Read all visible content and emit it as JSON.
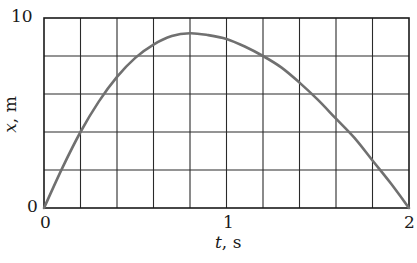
{
  "chart_data": {
    "type": "line",
    "title": "",
    "xlabel": "t, s",
    "xlabel_var": "t",
    "xlabel_unit": ", s",
    "ylabel": "x, m",
    "ylabel_var": "x",
    "ylabel_unit": ", m",
    "xlim": [
      0,
      2
    ],
    "ylim": [
      0,
      10
    ],
    "x_ticks": [
      0,
      1,
      2
    ],
    "x_tick_labels": [
      "0",
      "1",
      "2"
    ],
    "y_ticks": [
      0,
      10
    ],
    "y_tick_labels": [
      "0",
      "10"
    ],
    "grid": true,
    "grid_x_step": 0.2,
    "grid_y_step": 2,
    "legend": null,
    "series": [
      {
        "name": "x(t)",
        "color": "#707070",
        "x": [
          0,
          0.1,
          0.2,
          0.3,
          0.4,
          0.5,
          0.6,
          0.7,
          0.8,
          0.9,
          1.0,
          1.1,
          1.2,
          1.3,
          1.4,
          1.5,
          1.6,
          1.7,
          1.8,
          1.9,
          2.0
        ],
        "y": [
          0,
          2.1,
          4.0,
          5.6,
          6.9,
          7.9,
          8.6,
          9.05,
          9.2,
          9.1,
          8.9,
          8.5,
          8.0,
          7.4,
          6.6,
          5.7,
          4.7,
          3.7,
          2.5,
          1.3,
          0
        ]
      }
    ]
  },
  "colors": {
    "axis": "#1a1a1a",
    "grid": "#2a2a2a",
    "curve": "#707070"
  }
}
